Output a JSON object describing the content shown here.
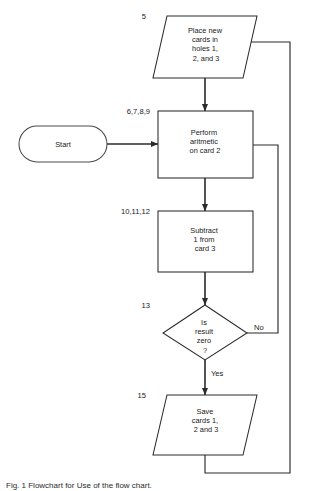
{
  "diagram": {
    "title_caption": "Fig. 1  Flowchart for Use of the flow chart.",
    "nodes": [
      {
        "id": "place-cards",
        "type": "parallelogram",
        "step": "5",
        "lines": [
          "Place new",
          "cards in",
          "holes 1,",
          "2, and 3"
        ]
      },
      {
        "id": "start",
        "type": "stadium",
        "step": "",
        "lines": [
          "Start"
        ]
      },
      {
        "id": "perform-arithmetic",
        "type": "process",
        "step": "6,7,8,9",
        "lines": [
          "Perform",
          "aritmetic",
          "on card 2"
        ]
      },
      {
        "id": "subtract",
        "type": "process",
        "step": "10,11,12",
        "lines": [
          "Subtract",
          "1 from",
          "card 3"
        ]
      },
      {
        "id": "is-result-zero",
        "type": "decision",
        "step": "13",
        "lines": [
          "Is",
          "result",
          "zero",
          "?"
        ]
      },
      {
        "id": "save-cards",
        "type": "parallelogram",
        "step": "15",
        "lines": [
          "Save",
          "cards  1,",
          "2 and 3"
        ]
      }
    ],
    "edge_labels": {
      "no": "No",
      "yes": "Yes"
    },
    "colors": {
      "stroke": "#2b2b2b",
      "fill": "#ffffff",
      "text": "#1a1a1a"
    }
  }
}
